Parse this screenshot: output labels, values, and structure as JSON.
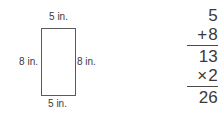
{
  "figure": {
    "shape_name": "rectangle",
    "labels": {
      "top": "5 in.",
      "bottom": "5 in.",
      "left": "8 in.",
      "right": "8 in."
    }
  },
  "math": {
    "rows": [
      {
        "operator": "",
        "value": "5"
      },
      {
        "operator": "+",
        "value": "8"
      },
      {
        "operator": "",
        "value": "13"
      },
      {
        "operator": "×",
        "value": "2"
      },
      {
        "operator": "",
        "value": "26"
      }
    ],
    "addend_1": "5",
    "addend_2": "8",
    "sum": "13",
    "multiplier": "2",
    "product": "26",
    "plus_sign": "+",
    "times_sign": "×"
  },
  "colors": {
    "background": "#ffffff",
    "stroke": "#5a5a5a",
    "text": "#3a3a3a",
    "rule": "#4a4a4a"
  }
}
